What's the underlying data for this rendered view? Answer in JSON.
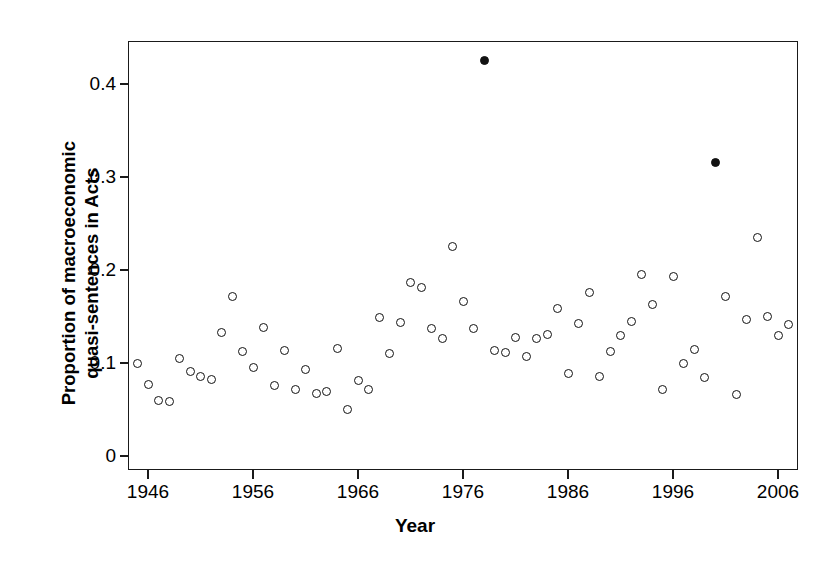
{
  "chart_data": {
    "type": "scatter",
    "title": "",
    "xlabel": "Year",
    "ylabel": "Proportion of macroeconomic quasi-sentences in Acts",
    "ylabel_line1": "Proportion of macroeconomic",
    "ylabel_line2": "quasi-sentences in Acts",
    "xlim": [
      1944.0,
      2007.8
    ],
    "ylim": [
      0.0,
      0.447
    ],
    "grid": false,
    "legend": null,
    "x_ticks": [
      1946,
      1956,
      1966,
      1976,
      1986,
      1996,
      2006
    ],
    "x_tick_labels": [
      "1946",
      "1956",
      "1966",
      "1976",
      "1986",
      "1996",
      "2006"
    ],
    "y_ticks": [
      0,
      0.1,
      0.2,
      0.3,
      0.4
    ],
    "y_tick_labels": [
      "0",
      "0.1",
      "0.2",
      "0.3",
      "0.4"
    ],
    "marker_open_color": "#ffffff",
    "marker_edge_color": "#121212",
    "marker_filled_color": "#121212",
    "frame_color": "#1a1a1a",
    "background": "#ffffff",
    "series": [
      {
        "name": "Proportion of macroeconomic quasi-sentences",
        "marker": "circle",
        "points": [
          {
            "x": 1945,
            "y": 0.099,
            "filled": false
          },
          {
            "x": 1946,
            "y": 0.077,
            "filled": false
          },
          {
            "x": 1947,
            "y": 0.06,
            "filled": false
          },
          {
            "x": 1948,
            "y": 0.059,
            "filled": false
          },
          {
            "x": 1949,
            "y": 0.105,
            "filled": false
          },
          {
            "x": 1950,
            "y": 0.091,
            "filled": false
          },
          {
            "x": 1951,
            "y": 0.086,
            "filled": false
          },
          {
            "x": 1952,
            "y": 0.082,
            "filled": false
          },
          {
            "x": 1953,
            "y": 0.133,
            "filled": false
          },
          {
            "x": 1954,
            "y": 0.172,
            "filled": false
          },
          {
            "x": 1955,
            "y": 0.112,
            "filled": false
          },
          {
            "x": 1956,
            "y": 0.095,
            "filled": false
          },
          {
            "x": 1957,
            "y": 0.138,
            "filled": false
          },
          {
            "x": 1958,
            "y": 0.076,
            "filled": false
          },
          {
            "x": 1959,
            "y": 0.113,
            "filled": false
          },
          {
            "x": 1960,
            "y": 0.072,
            "filled": false
          },
          {
            "x": 1961,
            "y": 0.093,
            "filled": false
          },
          {
            "x": 1962,
            "y": 0.067,
            "filled": false
          },
          {
            "x": 1963,
            "y": 0.069,
            "filled": false
          },
          {
            "x": 1964,
            "y": 0.116,
            "filled": false
          },
          {
            "x": 1965,
            "y": 0.05,
            "filled": false
          },
          {
            "x": 1966,
            "y": 0.081,
            "filled": false
          },
          {
            "x": 1967,
            "y": 0.071,
            "filled": false
          },
          {
            "x": 1968,
            "y": 0.149,
            "filled": false
          },
          {
            "x": 1969,
            "y": 0.11,
            "filled": false
          },
          {
            "x": 1970,
            "y": 0.144,
            "filled": false
          },
          {
            "x": 1971,
            "y": 0.187,
            "filled": false
          },
          {
            "x": 1972,
            "y": 0.181,
            "filled": false
          },
          {
            "x": 1973,
            "y": 0.137,
            "filled": false
          },
          {
            "x": 1974,
            "y": 0.126,
            "filled": false
          },
          {
            "x": 1975,
            "y": 0.225,
            "filled": false
          },
          {
            "x": 1976,
            "y": 0.166,
            "filled": false
          },
          {
            "x": 1977,
            "y": 0.137,
            "filled": false
          },
          {
            "x": 1978,
            "y": 0.425,
            "filled": true
          },
          {
            "x": 1979,
            "y": 0.113,
            "filled": false
          },
          {
            "x": 1980,
            "y": 0.111,
            "filled": false
          },
          {
            "x": 1981,
            "y": 0.127,
            "filled": false
          },
          {
            "x": 1982,
            "y": 0.107,
            "filled": false
          },
          {
            "x": 1983,
            "y": 0.126,
            "filled": false
          },
          {
            "x": 1984,
            "y": 0.131,
            "filled": false
          },
          {
            "x": 1985,
            "y": 0.159,
            "filled": false
          },
          {
            "x": 1986,
            "y": 0.089,
            "filled": false
          },
          {
            "x": 1987,
            "y": 0.143,
            "filled": false
          },
          {
            "x": 1988,
            "y": 0.176,
            "filled": false
          },
          {
            "x": 1989,
            "y": 0.086,
            "filled": false
          },
          {
            "x": 1990,
            "y": 0.112,
            "filled": false
          },
          {
            "x": 1991,
            "y": 0.13,
            "filled": false
          },
          {
            "x": 1992,
            "y": 0.145,
            "filled": false
          },
          {
            "x": 1993,
            "y": 0.195,
            "filled": false
          },
          {
            "x": 1994,
            "y": 0.163,
            "filled": false
          },
          {
            "x": 1995,
            "y": 0.072,
            "filled": false
          },
          {
            "x": 1996,
            "y": 0.193,
            "filled": false
          },
          {
            "x": 1997,
            "y": 0.1,
            "filled": false
          },
          {
            "x": 1998,
            "y": 0.114,
            "filled": false
          },
          {
            "x": 1999,
            "y": 0.084,
            "filled": false
          },
          {
            "x": 2000,
            "y": 0.316,
            "filled": true
          },
          {
            "x": 2001,
            "y": 0.172,
            "filled": false
          },
          {
            "x": 2002,
            "y": 0.066,
            "filled": false
          },
          {
            "x": 2003,
            "y": 0.147,
            "filled": false
          },
          {
            "x": 2004,
            "y": 0.235,
            "filled": false
          },
          {
            "x": 2005,
            "y": 0.15,
            "filled": false
          },
          {
            "x": 2006,
            "y": 0.13,
            "filled": false
          },
          {
            "x": 2007,
            "y": 0.141,
            "filled": false
          }
        ]
      }
    ]
  },
  "axes": {
    "x_title": "Year",
    "y_title_line1": "Proportion of macroeconomic",
    "y_title_line2": "quasi-sentences in Acts"
  }
}
